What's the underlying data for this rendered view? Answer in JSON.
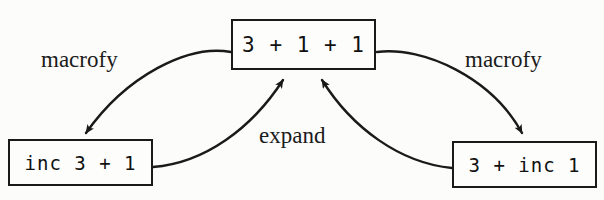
{
  "diagram": {
    "type": "rewrite-graph",
    "background_color": "#fcfcfa",
    "line_color": "#1a1a1a",
    "nodes": [
      {
        "id": "top",
        "label": "3 + 1 + 1",
        "x": 231,
        "y": 19,
        "width": 145,
        "height": 51
      },
      {
        "id": "left",
        "label": "inc 3 + 1",
        "x": 8,
        "y": 139,
        "width": 145,
        "height": 47
      },
      {
        "id": "right",
        "label": "3 + inc 1",
        "x": 452,
        "y": 141,
        "width": 145,
        "height": 47
      }
    ],
    "edges": [
      {
        "id": "top-to-left",
        "label": "macrofy",
        "from": "top",
        "to": "left",
        "direction": "down-left"
      },
      {
        "id": "top-to-right",
        "label": "macrofy",
        "from": "top",
        "to": "right",
        "direction": "down-right"
      },
      {
        "id": "left-to-top",
        "label": "expand",
        "from": "left",
        "to": "top",
        "direction": "up-right"
      },
      {
        "id": "right-to-top",
        "label": "expand",
        "from": "right",
        "to": "top",
        "direction": "up-left"
      }
    ],
    "labels": {
      "macrofy_left": "macrofy",
      "macrofy_right": "macrofy",
      "expand": "expand"
    }
  }
}
